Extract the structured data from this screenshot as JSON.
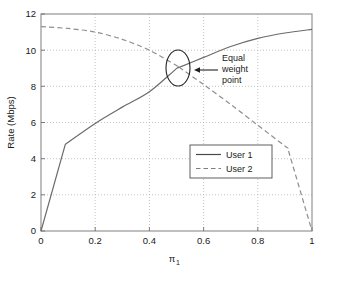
{
  "chart_data": {
    "type": "line",
    "title": "",
    "subtitle": "",
    "xlabel": "π",
    "xlabel_sub": "1",
    "ylabel": "Rate (Mbps)",
    "xlim": [
      0,
      1
    ],
    "ylim": [
      0,
      12
    ],
    "xticks": [
      0,
      0.2,
      0.4,
      0.6,
      0.8,
      1
    ],
    "xtick_labels": [
      "0",
      "0.2",
      "0.4",
      "0.6",
      "0.8",
      "1"
    ],
    "yticks": [
      0,
      2,
      4,
      6,
      8,
      10,
      12
    ],
    "ytick_labels": [
      "0",
      "2",
      "4",
      "6",
      "8",
      "10",
      "12"
    ],
    "grid": true,
    "grid_style": "dotted",
    "legend_position": "center-right",
    "series": [
      {
        "name": "User 1",
        "style": "solid",
        "color": "#6b6b6b",
        "x": [
          0,
          0.09,
          0.2,
          0.3,
          0.4,
          0.5,
          0.51,
          0.6,
          0.7,
          0.8,
          0.9,
          1.0
        ],
        "values": [
          0,
          4.8,
          5.95,
          6.85,
          7.7,
          8.98,
          9.05,
          9.6,
          10.2,
          10.65,
          10.95,
          11.15
        ]
      },
      {
        "name": "User 2",
        "style": "dashed",
        "color": "#8f8f8f",
        "x": [
          0,
          0.1,
          0.2,
          0.3,
          0.4,
          0.5,
          0.51,
          0.6,
          0.7,
          0.8,
          0.9,
          0.91,
          1.0
        ],
        "values": [
          11.3,
          11.2,
          11.0,
          10.6,
          10.0,
          9.15,
          9.05,
          8.1,
          7.0,
          5.85,
          4.7,
          4.6,
          0
        ]
      }
    ],
    "annotations": [
      {
        "name": "equal-weight-point",
        "text_lines": [
          "Equal",
          "weight",
          "point"
        ],
        "marker": "ellipse",
        "marker_center_x": 0.51,
        "marker_center_y": 9.05,
        "arrow": "left"
      }
    ]
  },
  "legend": {
    "entries": [
      {
        "label": "User 1"
      },
      {
        "label": "User 2"
      }
    ]
  },
  "axes": {
    "y_title": "Rate (Mbps)",
    "x_title_base": "π",
    "x_title_sub": "1"
  }
}
